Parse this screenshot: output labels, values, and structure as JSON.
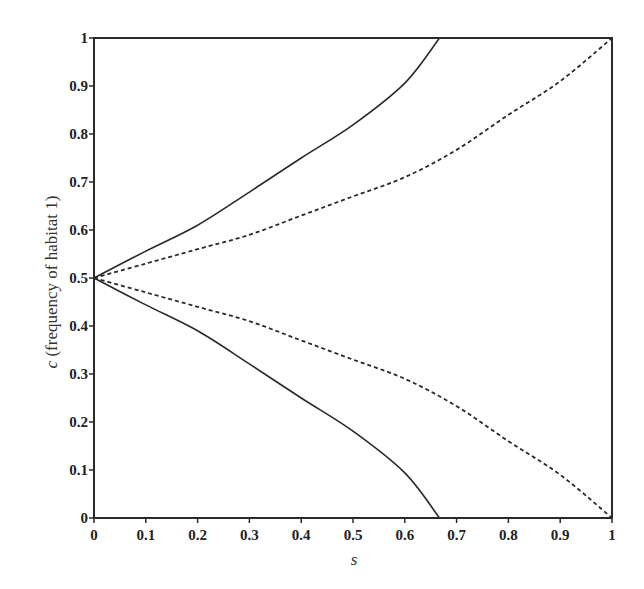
{
  "chart_data": {
    "type": "line",
    "title": "",
    "xlabel": "s",
    "ylabel": "c (frequency of habitat 1)",
    "ylabel_var": "c",
    "ylabel_rest": " (frequency of habitat 1)",
    "xlim": [
      0,
      1
    ],
    "ylim": [
      0,
      1
    ],
    "grid": false,
    "legend": null,
    "x_ticks": [
      "0",
      "0.1",
      "0.2",
      "0.3",
      "0.4",
      "0.5",
      "0.6",
      "0.7",
      "0.8",
      "0.9",
      "1"
    ],
    "y_ticks": [
      "0",
      "0.1",
      "0.2",
      "0.3",
      "0.4",
      "0.5",
      "0.6",
      "0.7",
      "0.8",
      "0.9",
      "1"
    ],
    "series": [
      {
        "name": "solid-upper",
        "style": "solid",
        "x": [
          0,
          0.1,
          0.2,
          0.3,
          0.4,
          0.5,
          0.6,
          0.667
        ],
        "y": [
          0.5,
          0.556,
          0.61,
          0.679,
          0.75,
          0.819,
          0.906,
          1.0
        ]
      },
      {
        "name": "solid-lower",
        "style": "solid",
        "x": [
          0,
          0.1,
          0.2,
          0.3,
          0.4,
          0.5,
          0.6,
          0.667
        ],
        "y": [
          0.5,
          0.444,
          0.39,
          0.321,
          0.25,
          0.181,
          0.094,
          0.0
        ]
      },
      {
        "name": "dashed-upper",
        "style": "dashed",
        "x": [
          0,
          0.1,
          0.2,
          0.3,
          0.4,
          0.5,
          0.6,
          0.7,
          0.8,
          0.9,
          1.0
        ],
        "y": [
          0.5,
          0.53,
          0.56,
          0.59,
          0.63,
          0.67,
          0.71,
          0.767,
          0.84,
          0.91,
          1.0
        ]
      },
      {
        "name": "dashed-lower",
        "style": "dashed",
        "x": [
          0,
          0.1,
          0.2,
          0.3,
          0.4,
          0.5,
          0.6,
          0.7,
          0.8,
          0.9,
          1.0
        ],
        "y": [
          0.5,
          0.47,
          0.44,
          0.41,
          0.37,
          0.33,
          0.29,
          0.233,
          0.16,
          0.09,
          0.0
        ]
      }
    ]
  }
}
